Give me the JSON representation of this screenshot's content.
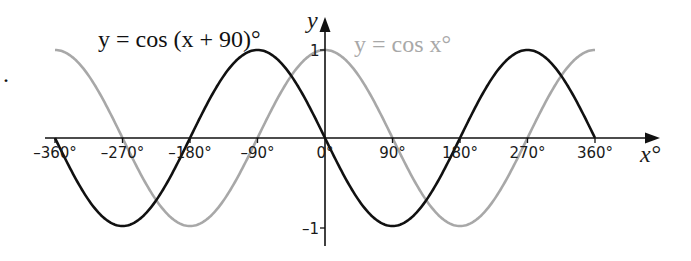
{
  "chart_data": {
    "type": "line",
    "title": "",
    "xlabel": "x°",
    "ylabel": "y",
    "xlim": [
      -360,
      360
    ],
    "ylim": [
      -1,
      1
    ],
    "grid": false,
    "x_ticks": [
      "–360°",
      "–270°",
      "–180°",
      "–90°",
      "0°",
      "90°",
      "180°",
      "270°",
      "360°"
    ],
    "x_tick_values": [
      -360,
      -270,
      -180,
      -90,
      0,
      90,
      180,
      270,
      360
    ],
    "y_ticks": [
      "1",
      "–1"
    ],
    "y_tick_values": [
      1,
      -1
    ],
    "x": [
      -360,
      -270,
      -180,
      -90,
      0,
      90,
      180,
      270,
      360
    ],
    "series": [
      {
        "name": "y = cos (x + 90)°",
        "color": "#111111",
        "values": [
          0,
          -1,
          0,
          1,
          0,
          -1,
          0,
          1,
          0
        ]
      },
      {
        "name": "y = cos x°",
        "color": "#a8a8a8",
        "values": [
          1,
          0,
          -1,
          0,
          1,
          0,
          -1,
          0,
          1
        ]
      }
    ],
    "annotations": [
      {
        "text": "y = cos (x + 90)°",
        "series": 0
      },
      {
        "text": "y = cos x°",
        "series": 1
      }
    ]
  },
  "labels": {
    "eq_black": "y = cos (x + 90)°",
    "eq_gray": "y = cos x°",
    "y_axis": "y",
    "x_axis": "x°",
    "y_one": "1",
    "y_minus_one": "–1",
    "bullet": "."
  }
}
